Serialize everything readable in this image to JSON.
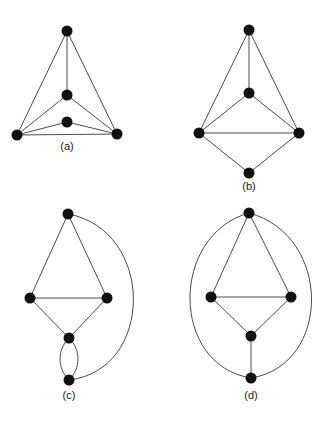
{
  "figure": {
    "panels": [
      {
        "id": "a",
        "label": "(a)",
        "label_pos": [
          67,
          150
        ],
        "vertices": [
          [
            67,
            31
          ],
          [
            67,
            95
          ],
          [
            67,
            122
          ],
          [
            17,
            135
          ],
          [
            117,
            134
          ]
        ],
        "edges": [
          [
            0,
            1
          ],
          [
            0,
            3
          ],
          [
            0,
            4
          ],
          [
            1,
            3
          ],
          [
            1,
            4
          ],
          [
            2,
            3
          ],
          [
            2,
            4
          ],
          [
            3,
            4
          ]
        ],
        "curves": []
      },
      {
        "id": "b",
        "label": "(b)",
        "label_pos": [
          249,
          190
        ],
        "vertices": [
          [
            249,
            30
          ],
          [
            249,
            93
          ],
          [
            199,
            133
          ],
          [
            299,
            133
          ],
          [
            249,
            173
          ]
        ],
        "edges": [
          [
            0,
            1
          ],
          [
            0,
            2
          ],
          [
            0,
            3
          ],
          [
            1,
            2
          ],
          [
            1,
            3
          ],
          [
            2,
            3
          ],
          [
            2,
            4
          ],
          [
            3,
            4
          ]
        ],
        "curves": []
      },
      {
        "id": "c",
        "label": "(c)",
        "label_pos": [
          69,
          399
        ],
        "vertices": [
          [
            68,
            214
          ],
          [
            30,
            298
          ],
          [
            107,
            298
          ],
          [
            69,
            338
          ],
          [
            69,
            380
          ]
        ],
        "edges": [
          [
            0,
            1
          ],
          [
            0,
            2
          ],
          [
            1,
            2
          ],
          [
            1,
            3
          ],
          [
            2,
            3
          ]
        ],
        "curves": [
          "M 68 214 C 155 230, 155 370, 69 380",
          "M 69 338 C 57 350, 57 368, 69 380",
          "M 69 338 C 81 350, 81 368, 69 380"
        ]
      },
      {
        "id": "d",
        "label": "(d)",
        "label_pos": [
          251,
          399
        ],
        "vertices": [
          [
            249,
            213
          ],
          [
            211,
            297
          ],
          [
            291,
            297
          ],
          [
            251,
            336
          ],
          [
            251,
            378
          ]
        ],
        "edges": [
          [
            0,
            1
          ],
          [
            0,
            2
          ],
          [
            1,
            2
          ],
          [
            1,
            3
          ],
          [
            2,
            3
          ],
          [
            3,
            4
          ]
        ],
        "curves": [
          "M 249 213 C 170 235, 170 365, 251 378",
          "M 249 213 C 332 235, 332 365, 251 378"
        ]
      }
    ],
    "colors": {
      "edge": "#4a4a4a",
      "vertex": "#111111",
      "background": "#ffffff"
    },
    "vertex_radius": 5.5
  }
}
